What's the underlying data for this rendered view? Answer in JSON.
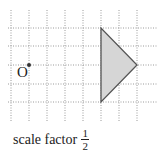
{
  "diagram": {
    "type": "enlargement",
    "grid": {
      "x_lines": [
        11,
        29,
        47,
        65,
        83,
        101,
        119,
        137
      ],
      "y_lines": [
        28,
        46,
        65,
        84,
        102
      ],
      "x_extent": [
        8,
        157
      ],
      "y_extent": [
        10,
        122
      ],
      "color": "#9a9a9a"
    },
    "center": {
      "label": "O",
      "x": 29,
      "y": 65
    },
    "shape": {
      "name": "triangle",
      "vertices": [
        [
          101,
          28
        ],
        [
          101,
          102
        ],
        [
          137,
          65
        ]
      ],
      "fill": "#d6d6d6",
      "stroke": "#555555"
    },
    "caption": {
      "text": "scale factor",
      "fraction_numerator": "1",
      "fraction_denominator": "2"
    }
  }
}
